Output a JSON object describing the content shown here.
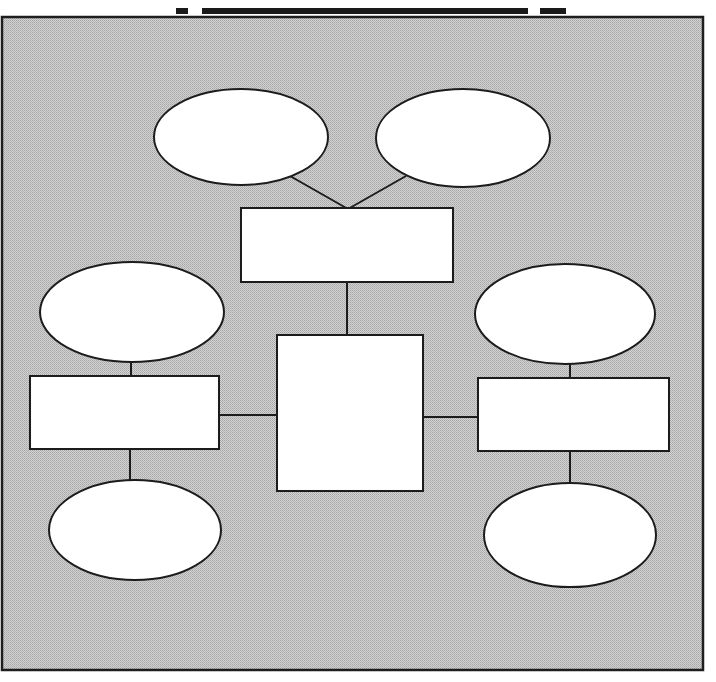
{
  "title": {
    "text": "",
    "note": "clipped"
  },
  "colors": {
    "background": "#ffffff",
    "frame_fill_a": "#cfcfcf",
    "frame_fill_b": "#a9a9a9",
    "stroke": "#1c1c1c",
    "node_fill": "#ffffff"
  },
  "diagram": {
    "frame": {
      "x": 2,
      "y": 17,
      "w": 701,
      "h": 653
    },
    "nodes": [
      {
        "id": "top-left-oval",
        "shape": "ellipse",
        "cx": 241,
        "cy": 137,
        "rx": 87,
        "ry": 48,
        "label": ""
      },
      {
        "id": "top-right-oval",
        "shape": "ellipse",
        "cx": 463,
        "cy": 138,
        "rx": 87,
        "ry": 49,
        "label": ""
      },
      {
        "id": "top-box",
        "shape": "rect",
        "x": 241,
        "y": 208,
        "w": 212,
        "h": 74,
        "label": ""
      },
      {
        "id": "center-box",
        "shape": "rect",
        "x": 277,
        "y": 335,
        "w": 146,
        "h": 156,
        "label": ""
      },
      {
        "id": "left-oval",
        "shape": "ellipse",
        "cx": 132,
        "cy": 312,
        "rx": 92,
        "ry": 50,
        "label": ""
      },
      {
        "id": "left-box",
        "shape": "rect",
        "x": 30,
        "y": 376,
        "w": 189,
        "h": 73,
        "label": ""
      },
      {
        "id": "bottom-left-oval",
        "shape": "ellipse",
        "cx": 135,
        "cy": 530,
        "rx": 86,
        "ry": 50,
        "label": ""
      },
      {
        "id": "right-oval",
        "shape": "ellipse",
        "cx": 565,
        "cy": 314,
        "rx": 90,
        "ry": 50,
        "label": ""
      },
      {
        "id": "right-box",
        "shape": "rect",
        "x": 478,
        "y": 378,
        "w": 191,
        "h": 73,
        "label": ""
      },
      {
        "id": "bottom-right-oval",
        "shape": "ellipse",
        "cx": 570,
        "cy": 535,
        "rx": 86,
        "ry": 52,
        "label": ""
      }
    ],
    "edges": [
      {
        "from": "top-left-oval",
        "to": "top-box",
        "x1": 290,
        "y1": 176,
        "x2": 348,
        "y2": 209
      },
      {
        "from": "top-right-oval",
        "to": "top-box",
        "x1": 406,
        "y1": 176,
        "x2": 348,
        "y2": 209
      },
      {
        "from": "top-box",
        "to": "center-box",
        "x1": 347,
        "y1": 282,
        "x2": 347,
        "y2": 335
      },
      {
        "from": "left-box",
        "to": "center-box",
        "x1": 219,
        "y1": 415,
        "x2": 277,
        "y2": 415
      },
      {
        "from": "center-box",
        "to": "right-box",
        "x1": 423,
        "y1": 417,
        "x2": 478,
        "y2": 417
      },
      {
        "from": "left-oval",
        "to": "left-box",
        "x1": 131,
        "y1": 362,
        "x2": 131,
        "y2": 376
      },
      {
        "from": "left-box",
        "to": "bottom-left-oval",
        "x1": 130,
        "y1": 449,
        "x2": 130,
        "y2": 480
      },
      {
        "from": "right-oval",
        "to": "right-box",
        "x1": 570,
        "y1": 364,
        "x2": 570,
        "y2": 378
      },
      {
        "from": "right-box",
        "to": "bottom-right-oval",
        "x1": 570,
        "y1": 451,
        "x2": 570,
        "y2": 483
      }
    ]
  }
}
